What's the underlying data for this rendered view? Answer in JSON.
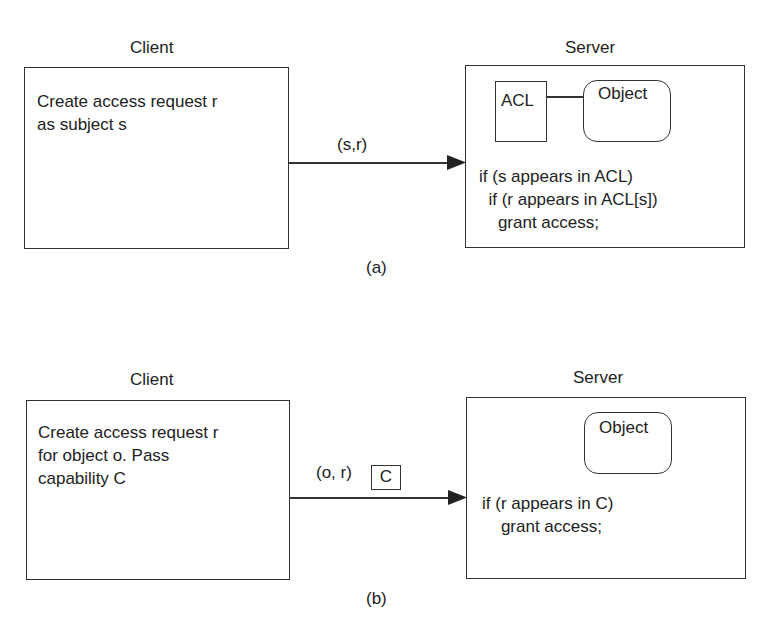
{
  "diagram_a": {
    "caption": "(a)",
    "client": {
      "title": "Client",
      "text": "Create access request r\nas subject s"
    },
    "message": "(s,r)",
    "server": {
      "title": "Server",
      "acl_label": "ACL",
      "object_label": "Object",
      "code": "if (s appears in ACL)\n  if (r appears in ACL[s])\n    grant access;"
    }
  },
  "diagram_b": {
    "caption": "(b)",
    "client": {
      "title": "Client",
      "text": "Create access request r\nfor object o. Pass\ncapability C"
    },
    "message": "(o, r)",
    "capability_label": "C",
    "server": {
      "title": "Server",
      "object_label": "Object",
      "code": "if (r appears in C)\n    grant access;"
    }
  },
  "colors": {
    "stroke": "#333333",
    "text": "#222222",
    "background": "#ffffff"
  }
}
